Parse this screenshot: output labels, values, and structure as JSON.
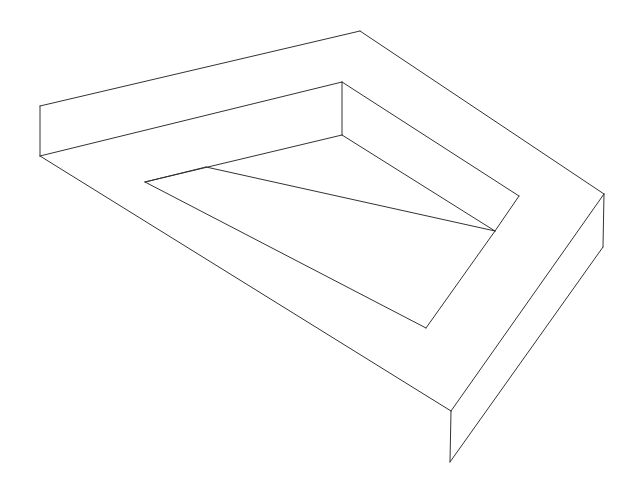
{
  "figure": {
    "stroke_color": "#333333",
    "background": "#ffffff",
    "edges": [
      [
        40,
        106,
        360,
        31
      ],
      [
        360,
        31,
        604,
        194
      ],
      [
        40,
        106,
        40,
        156
      ],
      [
        40,
        156,
        342,
        82
      ],
      [
        342,
        82,
        342,
        135
      ],
      [
        342,
        82,
        519,
        196
      ],
      [
        519,
        196,
        495,
        231
      ],
      [
        342,
        135,
        495,
        231
      ],
      [
        145,
        182,
        342,
        135
      ],
      [
        206,
        167,
        495,
        231
      ],
      [
        145,
        182,
        426,
        328
      ],
      [
        426,
        328,
        495,
        231
      ],
      [
        40,
        156,
        451,
        411
      ],
      [
        451,
        411,
        604,
        194
      ],
      [
        604,
        194,
        603,
        247
      ],
      [
        603,
        247,
        450,
        462
      ],
      [
        451,
        411,
        450,
        462
      ],
      [
        145,
        182,
        206,
        167
      ]
    ]
  }
}
